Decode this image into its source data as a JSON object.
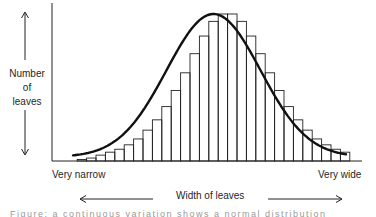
{
  "chart_data": {
    "type": "bar",
    "subtype": "histogram-with-normal-curve",
    "title": "",
    "xlabel": "Width of leaves",
    "ylabel": "Number of leaves",
    "x_axis_ends": {
      "left": "Very narrow",
      "right": "Very wide"
    },
    "categories": [
      "1",
      "2",
      "3",
      "4",
      "5",
      "6",
      "7",
      "8",
      "9",
      "10",
      "11",
      "12",
      "13",
      "14",
      "15",
      "16",
      "17",
      "18",
      "19",
      "20",
      "21",
      "22",
      "23",
      "24",
      "25",
      "26",
      "27",
      "28",
      "29"
    ],
    "values": [
      1,
      2,
      4,
      6,
      8,
      11,
      15,
      21,
      28,
      37,
      48,
      60,
      73,
      85,
      95,
      100,
      100,
      95,
      85,
      73,
      60,
      48,
      37,
      28,
      21,
      15,
      11,
      8,
      6
    ],
    "overlay": "normal distribution curve (bell-shaped)",
    "grid": false,
    "legend": "none",
    "ylim": [
      0,
      100
    ],
    "colors": {
      "bar_stroke": "#222222",
      "curve": "#111111",
      "axis": "#222222"
    }
  },
  "labels": {
    "ylabel_lines": [
      "Number",
      "of",
      "leaves"
    ],
    "left_end": "Very narrow",
    "right_end": "Very wide",
    "xlabel": "Width of leaves"
  },
  "caption": "Figure: a continuous variation shows a normal distribution"
}
